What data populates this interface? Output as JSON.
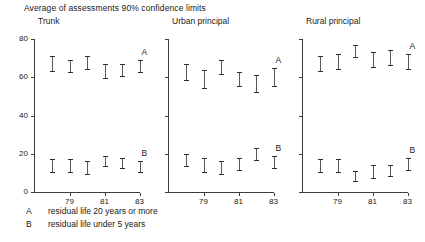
{
  "chart_data": {
    "type": "scatter",
    "title": "Average of assessments 90% confidence limits",
    "xlabel": "",
    "ylabel": "",
    "ylim": [
      0,
      80
    ],
    "yticks": [
      0,
      20,
      40,
      60,
      80
    ],
    "xticks": [
      79,
      81,
      83
    ],
    "xticklabels": [
      "79",
      "81",
      "83"
    ],
    "x": [
      78,
      79,
      80,
      81,
      82,
      83
    ],
    "grid": false,
    "legend_position": "below-left",
    "series_labels": [
      "A",
      "B"
    ],
    "panels": [
      {
        "name": "Trunk",
        "series": [
          {
            "name": "A",
            "label": "A",
            "low": [
              63,
              62,
              64,
              59,
              60,
              62
            ],
            "high": [
              71,
              69,
              71,
              67,
              67,
              69
            ],
            "mid": [
              67,
              66,
              68,
              63,
              64,
              66
            ]
          },
          {
            "name": "B",
            "label": "B",
            "low": [
              10,
              10,
              9,
              13,
              12,
              10
            ],
            "high": [
              17,
              17,
              16,
              19,
              18,
              16
            ],
            "mid": [
              14,
              14,
              13,
              16,
              15,
              13
            ]
          }
        ]
      },
      {
        "name": "Urban principal",
        "series": [
          {
            "name": "A",
            "label": "A",
            "low": [
              58,
              54,
              61,
              55,
              52,
              55
            ],
            "high": [
              67,
              64,
              69,
              63,
              61,
              65
            ],
            "mid": [
              63,
              59,
              65,
              59,
              57,
              60
            ]
          },
          {
            "name": "B",
            "label": "B",
            "low": [
              13,
              10,
              9,
              11,
              16,
              12
            ],
            "high": [
              20,
              18,
              16,
              18,
              23,
              19
            ],
            "mid": [
              17,
              14,
              13,
              15,
              20,
              16
            ]
          }
        ]
      },
      {
        "name": "Rural principal",
        "series": [
          {
            "name": "A",
            "label": "A",
            "low": [
              63,
              64,
              70,
              65,
              66,
              64
            ],
            "high": [
              71,
              72,
              77,
              73,
              74,
              72
            ],
            "mid": [
              67,
              68,
              74,
              69,
              70,
              68
            ]
          },
          {
            "name": "B",
            "label": "B",
            "low": [
              10,
              10,
              5,
              7,
              8,
              11
            ],
            "high": [
              17,
              17,
              11,
              14,
              14,
              18
            ],
            "mid": [
              14,
              14,
              8,
              11,
              11,
              15
            ]
          }
        ]
      }
    ],
    "legend": [
      {
        "key": "A",
        "text": "residual life 20 years or more"
      },
      {
        "key": "B",
        "text": "residual life under 5 years"
      }
    ]
  }
}
